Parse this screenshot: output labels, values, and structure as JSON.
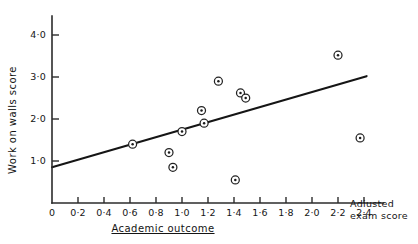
{
  "chart_data": {
    "type": "scatter",
    "title": "",
    "xlabel": "Academic outcome",
    "ylabel": "Work on walls score",
    "x_axis_corner_label_line1": "Adiusted",
    "x_axis_corner_label_line2": "exam score",
    "xlim": [
      0,
      2.55
    ],
    "ylim": [
      0,
      4.45
    ],
    "grid": false,
    "legend": null,
    "x_tick_labels": [
      "0",
      "0·2",
      "0·4",
      "0·6",
      "0·8",
      "1·0",
      "1·2",
      "1·4",
      "1·6",
      "1·8",
      "2·0",
      "2·2",
      "2·4"
    ],
    "x_tick_values": [
      0,
      0.2,
      0.4,
      0.6,
      0.8,
      1.0,
      1.2,
      1.4,
      1.6,
      1.8,
      2.0,
      2.2,
      2.4
    ],
    "y_tick_labels": [
      "1·0",
      "2·0",
      "3·0",
      "4·0"
    ],
    "y_tick_values": [
      1.0,
      2.0,
      3.0,
      4.0
    ],
    "origin_label": "0",
    "points": [
      {
        "x": 0.62,
        "y": 1.4
      },
      {
        "x": 0.9,
        "y": 1.2
      },
      {
        "x": 0.93,
        "y": 0.85
      },
      {
        "x": 1.0,
        "y": 1.7
      },
      {
        "x": 1.15,
        "y": 2.2
      },
      {
        "x": 1.17,
        "y": 1.9
      },
      {
        "x": 1.28,
        "y": 2.9
      },
      {
        "x": 1.41,
        "y": 0.55
      },
      {
        "x": 1.45,
        "y": 2.62
      },
      {
        "x": 1.49,
        "y": 2.5
      },
      {
        "x": 2.2,
        "y": 3.52
      },
      {
        "x": 2.37,
        "y": 1.55
      }
    ],
    "fit_line": {
      "x1": 0.0,
      "y1": 0.85,
      "x2": 2.42,
      "y2": 3.02
    },
    "marker_style": "circle-with-center-dot",
    "colors": {
      "axis": "#2b2b2b",
      "marker_edge": "#232323",
      "marker_face": "#ffffff",
      "marker_dot": "#1b1b1b",
      "fit_line": "#151515",
      "text": "#141414",
      "background": "#ffffff"
    }
  }
}
